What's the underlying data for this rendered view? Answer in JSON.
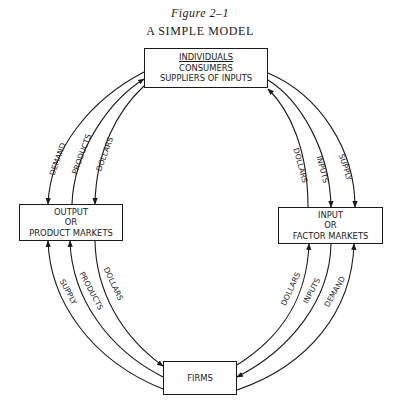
{
  "figure": {
    "number": "Figure 2–1",
    "title": "A SIMPLE MODEL"
  },
  "nodes": {
    "individuals": {
      "heading": "INDIVIDUALS",
      "line2": "CONSUMERS",
      "line3": "SUPPLIERS OF INPUTS"
    },
    "output_markets": {
      "line1": "OUTPUT",
      "line2": "OR",
      "line3": "PRODUCT MARKETS"
    },
    "input_markets": {
      "line1": "INPUT",
      "line2": "OR",
      "line3": "FACTOR MARKETS"
    },
    "firms": {
      "label": "FIRMS"
    }
  },
  "flows": {
    "upper_left": [
      {
        "label": "DEMAND",
        "from": "individuals",
        "to": "output_markets"
      },
      {
        "label": "PRODUCTS",
        "from": "output_markets",
        "to": "individuals"
      },
      {
        "label": "DOLLARS",
        "from": "individuals",
        "to": "output_markets"
      }
    ],
    "upper_right": [
      {
        "label": "DOLLARS",
        "from": "input_markets",
        "to": "individuals"
      },
      {
        "label": "INPUTS",
        "from": "individuals",
        "to": "input_markets"
      },
      {
        "label": "SUPPLY",
        "from": "individuals",
        "to": "input_markets"
      }
    ],
    "lower_left": [
      {
        "label": "SUPPLY",
        "from": "firms",
        "to": "output_markets"
      },
      {
        "label": "PRODUCTS",
        "from": "firms",
        "to": "output_markets"
      },
      {
        "label": "DOLLARS",
        "from": "output_markets",
        "to": "firms"
      }
    ],
    "lower_right": [
      {
        "label": "DOLLARS",
        "from": "firms",
        "to": "input_markets"
      },
      {
        "label": "INPUTS",
        "from": "input_markets",
        "to": "firms"
      },
      {
        "label": "DEMAND",
        "from": "firms",
        "to": "input_markets"
      }
    ]
  },
  "colors": {
    "ink": "#1a1a1a",
    "background": "#ffffff"
  }
}
